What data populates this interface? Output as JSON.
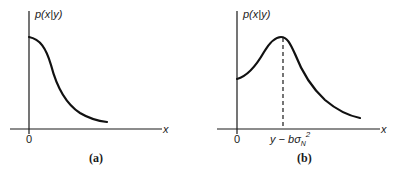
{
  "panels": [
    {
      "id": "a",
      "caption": "(a)",
      "y_label": "p(x|y)",
      "x_label": "x",
      "origin_label": "0",
      "curve": "monotonically decreasing from positive value at x=0"
    },
    {
      "id": "b",
      "caption": "(b)",
      "y_label": "p(x|y)",
      "x_label": "x",
      "origin_label": "0",
      "peak_label_base": "y − bσ",
      "peak_label_sub": "N",
      "peak_label_sup": "2",
      "curve": "unimodal with peak at y − bσN², dashed line marks peak"
    }
  ]
}
